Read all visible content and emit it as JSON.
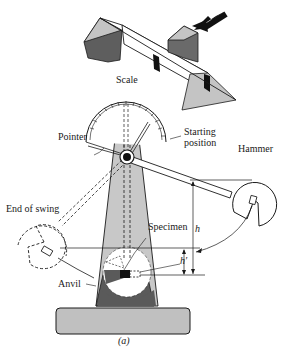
{
  "diagram": {
    "caption": "(a)",
    "labels": {
      "scale": "Scale",
      "pointer": "Pointer",
      "starting_position_line1": "Starting",
      "starting_position_line2": "position",
      "hammer": "Hammer",
      "end_of_swing": "End of swing",
      "specimen": "Specimen",
      "anvil": "Anvil",
      "h": "h",
      "h_prime": "h′"
    },
    "colors": {
      "ink": "#1a1a1a",
      "light_gray": "#c8c8c8",
      "mid_gray": "#a8a8a8",
      "dark_gray": "#5a5a5a",
      "black": "#111111",
      "white": "#ffffff"
    }
  }
}
